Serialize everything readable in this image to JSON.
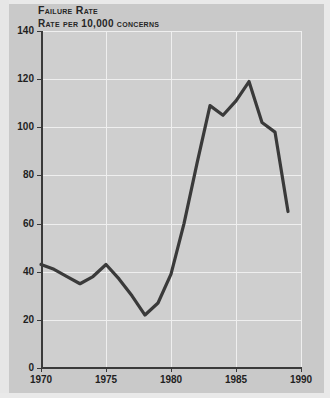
{
  "chart_data": {
    "type": "line",
    "title": "Failure Rate",
    "subtitle": "Rate per 10,000 concerns",
    "xlabel": "",
    "ylabel": "",
    "grid": true,
    "legend": "none",
    "xlim": [
      1970,
      1990
    ],
    "ylim": [
      0,
      140
    ],
    "xticks": [
      1970,
      1975,
      1980,
      1985,
      1990
    ],
    "yticks": [
      0,
      20,
      40,
      60,
      80,
      100,
      120,
      140
    ],
    "xtick_labels": [
      "1970",
      "1975",
      "1980",
      "1985",
      "1990"
    ],
    "ytick_labels": [
      "0",
      "20",
      "40",
      "60",
      "80",
      "100",
      "120",
      "140"
    ],
    "line_color": "#3a3a3a",
    "plot_background": "#cfcfcf",
    "figure_background": "#c9c9c9",
    "gridline_color": "#efefef",
    "x": [
      1970,
      1971,
      1972,
      1973,
      1974,
      1975,
      1976,
      1977,
      1978,
      1979,
      1980,
      1981,
      1982,
      1983,
      1984,
      1985,
      1986,
      1987,
      1988,
      1989
    ],
    "values": [
      43,
      41,
      38,
      35,
      38,
      43,
      37,
      30,
      22,
      27,
      39,
      60,
      85,
      109,
      105,
      111,
      119,
      102,
      98,
      65
    ],
    "series": [
      {
        "name": "Failure Rate",
        "values": [
          43,
          41,
          38,
          35,
          38,
          43,
          37,
          30,
          22,
          27,
          39,
          60,
          85,
          109,
          105,
          111,
          119,
          102,
          98,
          65
        ]
      }
    ]
  }
}
